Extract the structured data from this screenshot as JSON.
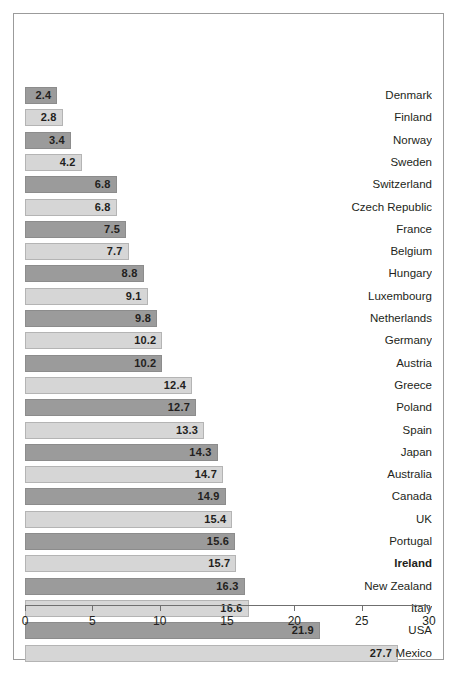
{
  "chart_data": {
    "type": "bar",
    "orientation": "horizontal",
    "title": "",
    "subtitle": "",
    "xlabel": "",
    "ylabel": "",
    "xlim": [
      0,
      30
    ],
    "xticks": [
      "0",
      "5",
      "10",
      "15",
      "20",
      "25",
      "30"
    ],
    "xtick_values": [
      0,
      5,
      10,
      15,
      20,
      25,
      30
    ],
    "grid": false,
    "legend": "none",
    "categories": [
      "Denmark",
      "Finland",
      "Norway",
      "Sweden",
      "Switzerland",
      "Czech Republic",
      "France",
      "Belgium",
      "Hungary",
      "Luxembourg",
      "Netherlands",
      "Germany",
      "Austria",
      "Greece",
      "Poland",
      "Spain",
      "Japan",
      "Australia",
      "Canada",
      "UK",
      "Portugal",
      "Ireland",
      "New Zealand",
      "Italy",
      "USA",
      "Mexico"
    ],
    "values": [
      2.4,
      2.8,
      3.4,
      4.2,
      6.8,
      6.8,
      7.5,
      7.7,
      8.8,
      9.1,
      9.8,
      10.2,
      10.2,
      12.4,
      12.7,
      13.3,
      14.3,
      14.7,
      14.9,
      15.4,
      15.6,
      15.7,
      16.3,
      16.6,
      21.9,
      27.7
    ],
    "value_labels": [
      "2.4",
      "2.8",
      "3.4",
      "4.2",
      "6.8",
      "6.8",
      "7.5",
      "7.7",
      "8.8",
      "9.1",
      "9.8",
      "10.2",
      "10.2",
      "12.4",
      "12.7",
      "13.3",
      "14.3",
      "14.7",
      "14.9",
      "15.4",
      "15.6",
      "15.7",
      "16.3",
      "16.6",
      "21.9",
      "27.7"
    ],
    "bar_shades": [
      "dark",
      "light",
      "dark",
      "light",
      "dark",
      "light",
      "dark",
      "light",
      "dark",
      "light",
      "dark",
      "light",
      "dark",
      "light",
      "dark",
      "light",
      "dark",
      "light",
      "dark",
      "light",
      "dark",
      "light",
      "dark",
      "light",
      "dark",
      "light"
    ],
    "highlighted_category": "Ireland",
    "colors": {
      "bar_dark": "#9b9b9b",
      "bar_light": "#d6d6d6",
      "bar_dark_border": "#8c8c8c",
      "bar_light_border": "#b4b4b4",
      "text": "#231f20",
      "axis": "#6f6f6f",
      "frame": "#9b9b9b",
      "background": "#ffffff"
    }
  }
}
